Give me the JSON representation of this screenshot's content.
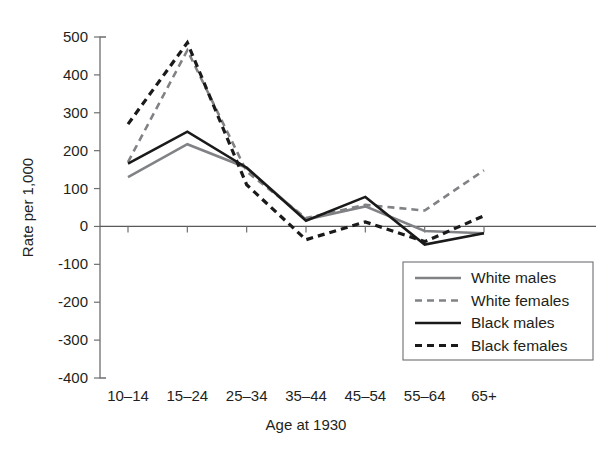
{
  "chart_data": {
    "type": "line",
    "title": "",
    "xlabel": "Age at 1930",
    "ylabel": "Rate per 1,000",
    "categories": [
      "10–14",
      "15–24",
      "25–34",
      "35–44",
      "45–54",
      "55–64",
      "65+"
    ],
    "ylim": [
      -400,
      500
    ],
    "ytick_labels": [
      "500",
      "400",
      "300",
      "200",
      "100",
      "0",
      "-100",
      "-200",
      "-300",
      "-400"
    ],
    "ytick_values": [
      500,
      400,
      300,
      200,
      100,
      0,
      -100,
      -200,
      -300,
      -400
    ],
    "grid": false,
    "zero_line": true,
    "legend_position": "lower-right-inside",
    "series": [
      {
        "name": "White males",
        "style": "solid",
        "color": "#808285",
        "values": [
          130,
          217,
          155,
          18,
          53,
          -12,
          -18
        ]
      },
      {
        "name": "White females",
        "style": "dashed",
        "color": "#808285",
        "values": [
          170,
          465,
          145,
          22,
          57,
          42,
          148
        ]
      },
      {
        "name": "Black males",
        "style": "solid",
        "color": "#1a1a1a",
        "values": [
          166,
          250,
          155,
          15,
          78,
          -48,
          -18
        ]
      },
      {
        "name": "Black females",
        "style": "dashed",
        "color": "#1a1a1a",
        "values": [
          270,
          485,
          110,
          -35,
          12,
          -40,
          28
        ]
      }
    ]
  }
}
